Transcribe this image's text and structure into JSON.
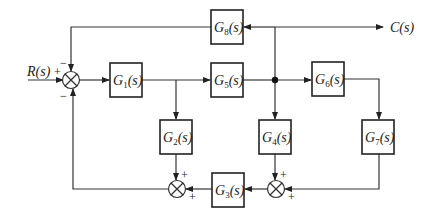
{
  "diagram": {
    "type": "control-system-block-diagram",
    "input": "R(s)",
    "output": "C(s)",
    "blocks": [
      {
        "id": "G1",
        "name": "G",
        "sub": "1",
        "tail": "(s)"
      },
      {
        "id": "G2",
        "name": "G",
        "sub": "2",
        "tail": "(s)"
      },
      {
        "id": "G3",
        "name": "G",
        "sub": "3",
        "tail": "(s)"
      },
      {
        "id": "G4",
        "name": "G",
        "sub": "4",
        "tail": "(s)"
      },
      {
        "id": "G5",
        "name": "G",
        "sub": "5",
        "tail": "(s)"
      },
      {
        "id": "G6",
        "name": "G",
        "sub": "6",
        "tail": "(s)"
      },
      {
        "id": "G7",
        "name": "G",
        "sub": "7",
        "tail": "(s)"
      },
      {
        "id": "G8",
        "name": "G",
        "sub": "8",
        "tail": "(s)"
      }
    ],
    "summing_junctions": [
      {
        "id": "S1",
        "signs": {
          "left": "+",
          "top": "−",
          "bottom": "−"
        }
      },
      {
        "id": "S2",
        "signs": {
          "top": "+",
          "right": "+"
        }
      },
      {
        "id": "S3",
        "signs": {
          "top": "+",
          "right": "+"
        }
      }
    ],
    "connections": [
      "R(s) → S1(+)",
      "S1 → G1",
      "G1 → G5",
      "G1 → G2",
      "G5 → node",
      "node → G6",
      "node → G4",
      "node → C(s)",
      "C(s) branch → G8",
      "G8 → S1(−) top",
      "G6 → G7",
      "G7 → S3(+)",
      "G4 → S3(+)",
      "S3 → G3",
      "G3 → S2(+)",
      "G2 → S2(+)",
      "S2 → S1(−) bottom"
    ]
  }
}
